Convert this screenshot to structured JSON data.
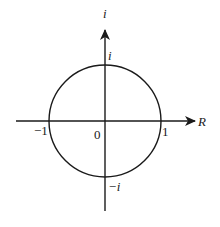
{
  "diagram": {
    "type": "complex-plane-unit-circle",
    "axes": {
      "horizontal_label": "R",
      "vertical_label": "i"
    },
    "labels": {
      "origin": "0",
      "positive_real": "1",
      "negative_real": "−1",
      "positive_imag": "i",
      "negative_imag": "−i"
    },
    "colors": {
      "stroke": "#1a1a1a",
      "background": "#ffffff"
    }
  }
}
